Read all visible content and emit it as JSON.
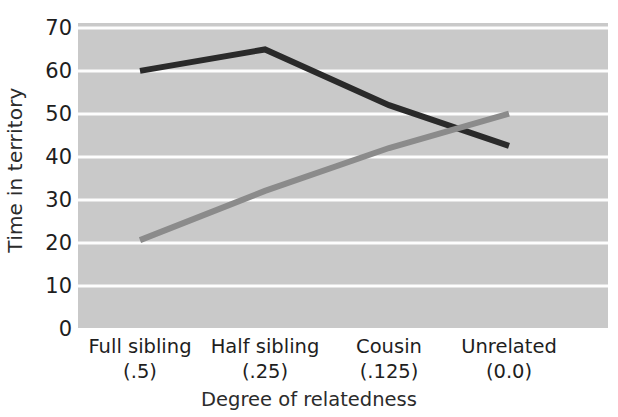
{
  "chart_data": {
    "type": "line",
    "title": "",
    "xlabel": "Degree of relatedness",
    "ylabel": "Time in territory",
    "categories": [
      "Full sibling",
      "Half sibling",
      "Cousin",
      "Unrelated"
    ],
    "category_values": [
      "(.5)",
      "(.25)",
      "(.125)",
      "(0.0)"
    ],
    "ytick_labels": [
      "70",
      "60",
      "50",
      "40",
      "30",
      "20",
      "10",
      "0"
    ],
    "yticks": [
      70,
      60,
      50,
      40,
      30,
      20,
      10,
      0
    ],
    "ylim": [
      0,
      70
    ],
    "grid": "horizontal",
    "legend": "none",
    "plot_background": "#c9c9c9",
    "gridline_color": "#fdfdfd",
    "series": [
      {
        "name": "dark-line",
        "color": "#2a2a2a",
        "values": [
          60,
          65,
          52,
          42.5
        ]
      },
      {
        "name": "gray-line",
        "color": "#8b8b8b",
        "values": [
          20.5,
          32,
          42,
          50
        ]
      }
    ]
  }
}
